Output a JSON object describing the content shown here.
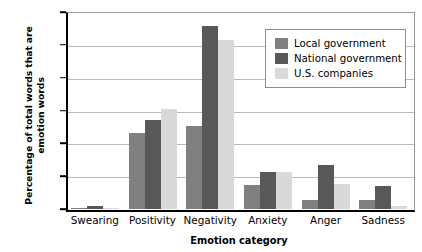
{
  "chart_data": {
    "type": "bar",
    "title": "",
    "xlabel": "Emotion category",
    "ylabel": "Percentage of total words that are emotion words",
    "categories": [
      "Swearing",
      "Positivity",
      "Negativity",
      "Anxiety",
      "Anger",
      "Sadness"
    ],
    "series": [
      {
        "name": "Local government",
        "color": "#808080",
        "values": [
          0.01,
          1.15,
          1.26,
          0.36,
          0.14,
          0.13
        ]
      },
      {
        "name": "National government",
        "color": "#585858",
        "values": [
          0.04,
          1.35,
          2.79,
          0.56,
          0.67,
          0.35
        ]
      },
      {
        "name": "U.S. companies",
        "color": "#d9d9d9",
        "values": [
          0.01,
          1.53,
          2.57,
          0.57,
          0.38,
          0.05
        ]
      }
    ],
    "ylim": [
      0,
      3.0
    ],
    "yticks": [
      0,
      0.5,
      1.0,
      1.5,
      2.0,
      2.5,
      3.0
    ],
    "ytick_labels": [
      "0",
      "0.5",
      "1.0",
      "1.5",
      "2.0",
      "2.5",
      "3.0"
    ],
    "grid": true,
    "legend_position": "top-right"
  }
}
